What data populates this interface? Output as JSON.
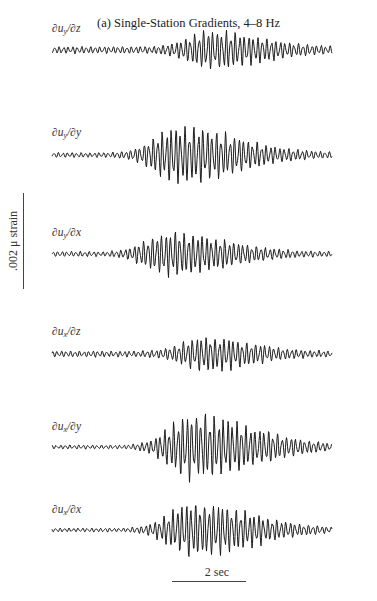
{
  "figure": {
    "title": "(a) Single-Station Gradients, 4–8 Hz",
    "strain_scale_label": ".002 μ strain",
    "time_scale_label": "2 sec"
  },
  "chart_data": {
    "type": "line",
    "title": "(a) Single-Station Gradients, 4–8 Hz",
    "xlabel": "time (scale bar: 2 sec)",
    "ylabel": "strain (scale bar: .002 μ strain)",
    "grid": false,
    "legend": "none (each trace labeled at left)",
    "x_extent_px": [
      52,
      332
    ],
    "series": [
      {
        "name": "∂u_y/∂z",
        "label_main": "∂u",
        "label_sub": "y",
        "label_tail": "/∂z",
        "baseline_y": 50,
        "label_y": 30,
        "peak_amp_px": 16,
        "peak_pos": 0.57,
        "onset": 0.2,
        "bg_amp": 3.5,
        "coda": 0.35,
        "seed": 1
      },
      {
        "name": "∂u_y/∂y",
        "label_main": "∂u",
        "label_sub": "y",
        "label_tail": "/∂y",
        "baseline_y": 155,
        "label_y": 134,
        "peak_amp_px": 26,
        "peak_pos": 0.45,
        "onset": 0.18,
        "bg_amp": 2.5,
        "coda": 0.5,
        "seed": 2
      },
      {
        "name": "∂u_y/∂x",
        "label_main": "∂u",
        "label_sub": "y",
        "label_tail": "/∂x",
        "baseline_y": 254,
        "label_y": 234,
        "peak_amp_px": 20,
        "peak_pos": 0.42,
        "onset": 0.2,
        "bg_amp": 2.5,
        "coda": 0.45,
        "seed": 3
      },
      {
        "name": "∂u_x/∂z",
        "label_main": "∂u",
        "label_sub": "x",
        "label_tail": "/∂z",
        "baseline_y": 354,
        "label_y": 333,
        "peak_amp_px": 14,
        "peak_pos": 0.55,
        "onset": 0.3,
        "bg_amp": 3,
        "coda": 0.3,
        "seed": 4
      },
      {
        "name": "∂u_x/∂y",
        "label_main": "∂u",
        "label_sub": "x",
        "label_tail": "/∂y",
        "baseline_y": 447,
        "label_y": 428,
        "peak_amp_px": 30,
        "peak_pos": 0.5,
        "onset": 0.27,
        "bg_amp": 2,
        "coda": 0.55,
        "seed": 5
      },
      {
        "name": "∂u_x/∂x",
        "label_main": "∂u",
        "label_sub": "x",
        "label_tail": "/∂x",
        "baseline_y": 530,
        "label_y": 511,
        "peak_amp_px": 25,
        "peak_pos": 0.5,
        "onset": 0.27,
        "bg_amp": 2,
        "coda": 0.5,
        "seed": 6
      }
    ]
  },
  "colors": {
    "trace": "#1a1a1a",
    "text": "#333333",
    "background": "#ffffff"
  }
}
